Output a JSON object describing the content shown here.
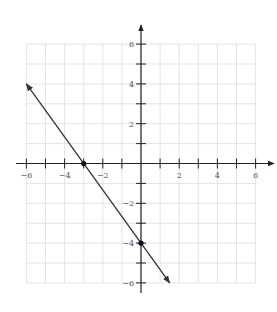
{
  "chart_data": {
    "type": "line",
    "title": "",
    "xlabel": "",
    "ylabel": "",
    "xlim": [
      -6,
      6
    ],
    "ylim": [
      -6,
      6
    ],
    "grid": true,
    "x_tick_labels": [
      "-6",
      "-4",
      "-2",
      "2",
      "4",
      "6"
    ],
    "x_tick_values": [
      -6,
      -4,
      -2,
      2,
      4,
      6
    ],
    "y_tick_labels": [
      "6",
      "4",
      "2",
      "-2",
      "-4",
      "-6"
    ],
    "y_tick_values": [
      6,
      4,
      2,
      -2,
      -4,
      -6
    ],
    "series": [
      {
        "name": "line",
        "equation": "y = -4/3 x - 4",
        "x": [
          -6,
          1.5
        ],
        "y": [
          4,
          -6
        ],
        "arrows": "both",
        "color": "#333333"
      }
    ],
    "points": [
      {
        "label": "x-intercept",
        "x": -3,
        "y": 0
      },
      {
        "label": "y-intercept",
        "x": 0,
        "y": -4
      }
    ]
  },
  "colors": {
    "grid": "#dcdcdc",
    "axis": "#222222",
    "line": "#333333"
  }
}
